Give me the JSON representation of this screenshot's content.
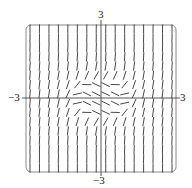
{
  "diagram": {
    "type": "slope-field",
    "labels": {
      "x_min": "−3",
      "x_max": "3",
      "y_min": "−3",
      "y_max": "3"
    },
    "x_range": [
      -3,
      3
    ],
    "y_range": [
      -3,
      3
    ],
    "grid_count": 16,
    "colors": {
      "stroke": "#333333",
      "frame": "#888888",
      "axes": "#444444"
    }
  }
}
